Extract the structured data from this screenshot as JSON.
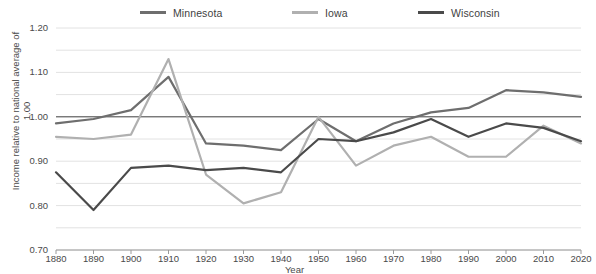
{
  "legend": {
    "items": [
      {
        "name": "minnesota",
        "label": "Minnesota",
        "color": "#6e6e6e"
      },
      {
        "name": "iowa",
        "label": "Iowa",
        "color": "#b0b0b0"
      },
      {
        "name": "wisconsin",
        "label": "Wisconsin",
        "color": "#4a4a4a"
      }
    ]
  },
  "axes": {
    "y_ticks": [
      "1.20",
      "1.10",
      "1.00",
      "0.90",
      "0.80",
      "0.70"
    ],
    "y_title": "Income relative to national average of 1.00",
    "x_title": "Year",
    "x_ticks": [
      "1880",
      "1890",
      "1900",
      "1910",
      "1920",
      "1930",
      "1940",
      "1950",
      "1960",
      "1970",
      "1980",
      "1990",
      "2000",
      "2010",
      "2020"
    ]
  },
  "chart_data": {
    "type": "line",
    "title": "",
    "xlabel": "Year",
    "ylabel": "Income relative to national average of 1.00",
    "xlim": [
      1880,
      2020
    ],
    "ylim": [
      0.7,
      1.2
    ],
    "ytick_step": 0.1,
    "gridline_step": 0.05,
    "grid": true,
    "legend_position": "top",
    "reference_line": 1.0,
    "x": [
      1880,
      1890,
      1900,
      1910,
      1920,
      1930,
      1940,
      1950,
      1960,
      1970,
      1980,
      1990,
      2000,
      2010,
      2020
    ],
    "series": [
      {
        "name": "Minnesota",
        "color": "#6e6e6e",
        "values": [
          0.985,
          0.995,
          1.015,
          1.09,
          0.94,
          0.935,
          0.925,
          0.995,
          0.945,
          0.985,
          1.01,
          1.02,
          1.06,
          1.055,
          1.045
        ]
      },
      {
        "name": "Iowa",
        "color": "#b0b0b0",
        "values": [
          0.955,
          0.95,
          0.96,
          1.13,
          0.87,
          0.805,
          0.83,
          1.0,
          0.89,
          0.935,
          0.955,
          0.91,
          0.91,
          0.98,
          0.94
        ]
      },
      {
        "name": "Wisconsin",
        "color": "#4a4a4a",
        "values": [
          0.875,
          0.79,
          0.885,
          0.89,
          0.88,
          0.885,
          0.875,
          0.95,
          0.945,
          0.965,
          0.995,
          0.955,
          0.985,
          0.975,
          0.945
        ]
      }
    ]
  }
}
